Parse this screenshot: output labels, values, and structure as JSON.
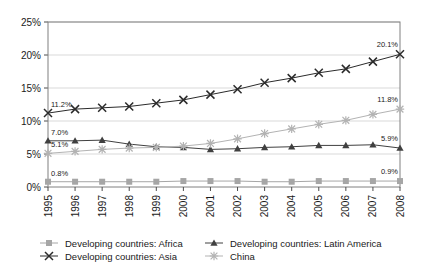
{
  "chart_data": {
    "type": "line",
    "title": "",
    "subtitle": "",
    "xlabel": "",
    "ylabel": "",
    "grid": true,
    "legend_position": "bottom",
    "ylim": [
      0,
      25
    ],
    "y_ticks": [
      "0%",
      "5%",
      "10%",
      "15%",
      "20%",
      "25%"
    ],
    "y_tick_values": [
      0,
      5,
      10,
      15,
      20,
      25
    ],
    "categories": [
      "1995",
      "1996",
      "1997",
      "1998",
      "1999",
      "2000",
      "2001",
      "2002",
      "2003",
      "2004",
      "2005",
      "2006",
      "2007",
      "2008"
    ],
    "series": [
      {
        "name": "Developing countries: Africa",
        "marker": "square",
        "color": "#a6a6a6",
        "values": [
          0.8,
          0.8,
          0.8,
          0.8,
          0.8,
          0.9,
          0.9,
          0.9,
          0.8,
          0.8,
          0.9,
          0.9,
          0.9,
          0.9
        ],
        "start_label": "0.8%",
        "end_label": "0.9%"
      },
      {
        "name": "Developing countries: Asia",
        "marker": "x",
        "color": "#2b2b2b",
        "values": [
          11.2,
          11.8,
          12.0,
          12.2,
          12.7,
          13.2,
          14.0,
          14.8,
          15.8,
          16.5,
          17.3,
          17.9,
          19.0,
          20.1
        ],
        "start_label": "11.2%",
        "end_label": "20.1%"
      },
      {
        "name": "Developing countries: Latin America",
        "marker": "triangle",
        "color": "#404040",
        "values": [
          7.0,
          7.0,
          7.1,
          6.5,
          6.1,
          6.0,
          5.7,
          5.8,
          6.0,
          6.1,
          6.3,
          6.3,
          6.4,
          5.9
        ],
        "start_label": "7.0%",
        "end_label": "5.9%"
      },
      {
        "name": "China",
        "marker": "asterisk",
        "color": "#b3b3b3",
        "values": [
          5.1,
          5.4,
          5.7,
          5.9,
          6.0,
          6.2,
          6.6,
          7.3,
          8.1,
          8.8,
          9.5,
          10.1,
          11.0,
          11.8
        ],
        "start_label": "5.1%",
        "end_label": "11.8%"
      }
    ],
    "annotations": [
      {
        "text": "11.2%",
        "series": "Developing countries: Asia",
        "side": "left"
      },
      {
        "text": "20.1%",
        "series": "Developing countries: Asia",
        "side": "right"
      },
      {
        "text": "7.0%",
        "series": "Developing countries: Latin America",
        "side": "left"
      },
      {
        "text": "5.9%",
        "series": "Developing countries: Latin America",
        "side": "right"
      },
      {
        "text": "5.1%",
        "series": "China",
        "side": "left"
      },
      {
        "text": "11.8%",
        "series": "China",
        "side": "right"
      },
      {
        "text": "0.8%",
        "series": "Developing countries: Africa",
        "side": "left"
      },
      {
        "text": "0.9%",
        "series": "Developing countries: Africa",
        "side": "right"
      }
    ]
  },
  "legend": {
    "items": [
      {
        "label": "Developing countries: Africa"
      },
      {
        "label": "Developing countries: Latin America"
      },
      {
        "label": "Developing countries: Asia"
      },
      {
        "label": "China"
      }
    ]
  }
}
